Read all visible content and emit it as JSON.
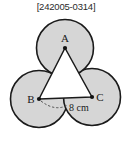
{
  "header": {
    "code": "[242005-0314]"
  },
  "figure": {
    "title_text": "",
    "vertices": [
      {
        "name": "A",
        "label": "A",
        "cx": 65,
        "cy": 48,
        "label_x": 65,
        "label_y": 41
      },
      {
        "name": "B",
        "label": "B",
        "cx": 39,
        "cy": 99,
        "label_x": 31,
        "label_y": 102
      },
      {
        "name": "C",
        "label": "C",
        "cx": 92,
        "cy": 97,
        "label_x": 100,
        "label_y": 101
      }
    ],
    "circles": [
      {
        "name": "circle-a",
        "cx": 65,
        "cy": 48,
        "r": 29
      },
      {
        "name": "circle-b",
        "cx": 39,
        "cy": 99,
        "r": 29
      },
      {
        "name": "circle-c",
        "cx": 92,
        "cy": 97,
        "r": 29
      }
    ],
    "dimension": {
      "label": "8 cm",
      "label_x": 69,
      "label_y": 110,
      "from": "B",
      "to": "C"
    },
    "colors": {
      "circle_fill": "#d6d6d6",
      "circle_stroke": "#1a1a1a",
      "triangle_stroke": "#1a1a1a",
      "dashed_stroke": "#4d4d4d",
      "text": "#1a1a1a",
      "background": "#ffffff"
    }
  }
}
